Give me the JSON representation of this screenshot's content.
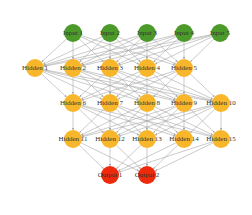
{
  "diagram": {
    "type": "neural-network",
    "colors": {
      "input": "#4c9a2a",
      "hidden": "#f8b62b",
      "output": "#ee2a0c",
      "edge": "#a8a8a8",
      "background": "#ffffff"
    },
    "node_radius": 9,
    "layers": [
      {
        "name": "input",
        "kind": "input",
        "nodes": [
          {
            "id": "in1",
            "label": "Input 1",
            "x": 73,
            "y": 33
          },
          {
            "id": "in2",
            "label": "Input 2",
            "x": 110,
            "y": 33
          },
          {
            "id": "in3",
            "label": "Input 3",
            "x": 147,
            "y": 33
          },
          {
            "id": "in4",
            "label": "Input 4",
            "x": 184,
            "y": 33
          },
          {
            "id": "in5",
            "label": "Input 5",
            "x": 220,
            "y": 33
          }
        ]
      },
      {
        "name": "hidden-1",
        "kind": "hidden",
        "nodes": [
          {
            "id": "h1",
            "label": "Hidden 1",
            "x": 35,
            "y": 68
          },
          {
            "id": "h2",
            "label": "Hidden 2",
            "x": 73,
            "y": 68
          },
          {
            "id": "h3",
            "label": "Hidden 3",
            "x": 110,
            "y": 68
          },
          {
            "id": "h4",
            "label": "Hidden 4",
            "x": 147,
            "y": 68
          },
          {
            "id": "h5",
            "label": "Hidden 5",
            "x": 184,
            "y": 68
          }
        ]
      },
      {
        "name": "hidden-2",
        "kind": "hidden",
        "nodes": [
          {
            "id": "h6",
            "label": "Hidden 6",
            "x": 73,
            "y": 103
          },
          {
            "id": "h7",
            "label": "Hidden 7",
            "x": 110,
            "y": 103
          },
          {
            "id": "h8",
            "label": "Hidden 8",
            "x": 147,
            "y": 103
          },
          {
            "id": "h9",
            "label": "Hidden 9",
            "x": 184,
            "y": 103
          },
          {
            "id": "h10",
            "label": "Hidden 10",
            "x": 221,
            "y": 103
          }
        ]
      },
      {
        "name": "hidden-3",
        "kind": "hidden",
        "nodes": [
          {
            "id": "h11",
            "label": "Hidden 11",
            "x": 73,
            "y": 139
          },
          {
            "id": "h12",
            "label": "Hidden 12",
            "x": 110,
            "y": 139
          },
          {
            "id": "h13",
            "label": "Hidden 13",
            "x": 147,
            "y": 139
          },
          {
            "id": "h14",
            "label": "Hidden 14",
            "x": 184,
            "y": 139
          },
          {
            "id": "h15",
            "label": "Hidden 15",
            "x": 221,
            "y": 139
          }
        ]
      },
      {
        "name": "output",
        "kind": "output",
        "nodes": [
          {
            "id": "out1",
            "label": "Output 1",
            "x": 110,
            "y": 175
          },
          {
            "id": "out2",
            "label": "Output 2",
            "x": 147,
            "y": 175
          }
        ]
      }
    ],
    "connectivity": "fully-connected-between-consecutive-layers"
  }
}
